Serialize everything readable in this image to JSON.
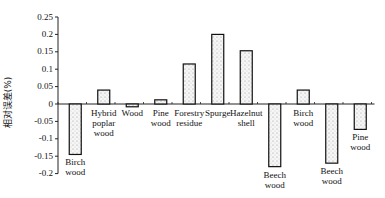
{
  "chart_data": {
    "type": "bar",
    "title": "",
    "xlabel": "",
    "ylabel": "相对误差(%)",
    "ylim": [
      -0.2,
      0.25
    ],
    "yticks": [
      0.25,
      0.2,
      0.15,
      0.1,
      0.05,
      0,
      -0.05,
      -0.1,
      -0.15,
      -0.2
    ],
    "ytick_labels": [
      "0.25",
      "0.2",
      "0.15",
      "0.1",
      "0.05",
      "0",
      "-0.05",
      "-0.1",
      "-0.15",
      "-0.2"
    ],
    "grid": false,
    "legend": null,
    "categories": [
      "Birch wood",
      "Hybrid poplar wood",
      "Wood",
      "Pine wood",
      "Forestry residue",
      "Spurge",
      "Hazelnut shell",
      "Beech wood",
      "Birch wood",
      "Beech wood",
      "Pine wood"
    ],
    "category_labels_display": [
      "Birch\nwood",
      "Hybrid\npoplar\nwood",
      "Wood",
      "Pine\nwood",
      "Forestry\nresidue",
      "Spurge",
      "Hazelnut\nshell",
      "Beech\nwood",
      "Birch\nwood",
      "Beech\nwood",
      "Pine\nwood"
    ],
    "values": [
      -0.145,
      0.04,
      -0.008,
      0.012,
      0.115,
      0.2,
      0.153,
      -0.18,
      0.04,
      -0.17,
      -0.073
    ],
    "bar_fill": "#f4f4f4",
    "bar_edge": "#111111",
    "bar_pattern": "dotted"
  }
}
